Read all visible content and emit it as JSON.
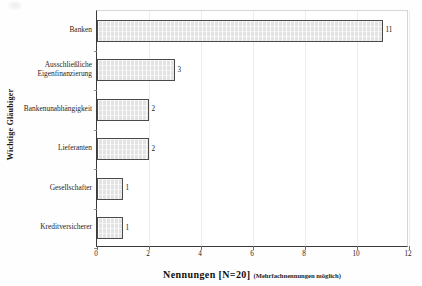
{
  "chart_data": {
    "type": "bar",
    "orientation": "horizontal",
    "title": "",
    "xlabel": "Nennungen [N=20]",
    "xlabel_note": "(Mehrfachnennungen möglich)",
    "ylabel": "Wichtige Gläubiger",
    "categories": [
      "Banken",
      "Ausschließliche Eigenfinanzierung",
      "Bankenunabhängigkeit",
      "Lieferanten",
      "Gesellschafter",
      "Kreditversicherer"
    ],
    "category_lines": [
      [
        "Banken"
      ],
      [
        "Ausschließliche",
        "Eigenfinanzierung"
      ],
      [
        "Bankenunabhängigkeit"
      ],
      [
        "Lieferanten"
      ],
      [
        "Gesellschafter"
      ],
      [
        "Kreditversicherer"
      ]
    ],
    "values": [
      11,
      3,
      2,
      2,
      1,
      1
    ],
    "value_labels": [
      "11",
      "3",
      "2",
      "2",
      "1",
      "1"
    ],
    "xlim": [
      0,
      12
    ],
    "xticks": [
      0,
      2,
      4,
      6,
      8,
      10,
      12
    ],
    "xtick_labels": [
      "0",
      "2",
      "4",
      "6",
      "8",
      "10",
      "12"
    ],
    "grid": true,
    "legend": false,
    "bar_fill_color": "#e3e3e3",
    "bar_border_color": "#4a4a4a",
    "axis_color": "#3a3a3a",
    "gridline_color": "#ededed"
  }
}
